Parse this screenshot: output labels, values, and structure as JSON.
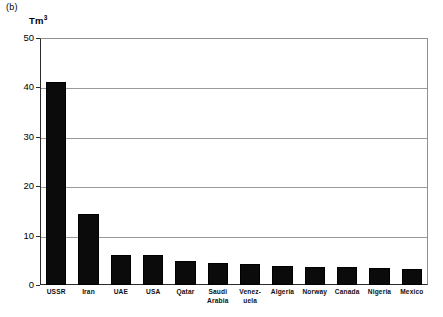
{
  "figure": {
    "panel_label": "(b)",
    "unit_label_main": "Tm",
    "unit_label_sup": "3"
  },
  "chart_data": {
    "type": "bar",
    "title": "",
    "subtitle": "",
    "xlabel": "",
    "ylabel": "Tm3",
    "ylim": [
      0,
      50
    ],
    "yticks": [
      0,
      10,
      20,
      30,
      40,
      50
    ],
    "ytick_labels": [
      "0",
      "10",
      "20",
      "30",
      "40",
      "50"
    ],
    "grid": "horizontal",
    "legend": "none",
    "bar_color": "#0b0b0b",
    "categories": [
      "USSR",
      "Iran",
      "UAE",
      "USA",
      "Qatar",
      "Saudi Arabia",
      "Venez-uela",
      "Algeria",
      "Norway",
      "Canada",
      "Nigeria",
      "Mexico"
    ],
    "category_labels": [
      [
        "USSR"
      ],
      [
        "Iran"
      ],
      [
        "UAE"
      ],
      [
        "USA"
      ],
      [
        "Qatar"
      ],
      [
        "Saudi",
        "Arabia"
      ],
      [
        "Venez-",
        "uela"
      ],
      [
        "Algeria"
      ],
      [
        "Norway"
      ],
      [
        "Canada"
      ],
      [
        "Nigeria"
      ],
      [
        "Mexico"
      ]
    ],
    "values": [
      41.0,
      14.3,
      6.1,
      6.0,
      4.9,
      4.5,
      4.2,
      3.9,
      3.7,
      3.6,
      3.4,
      3.2
    ]
  }
}
